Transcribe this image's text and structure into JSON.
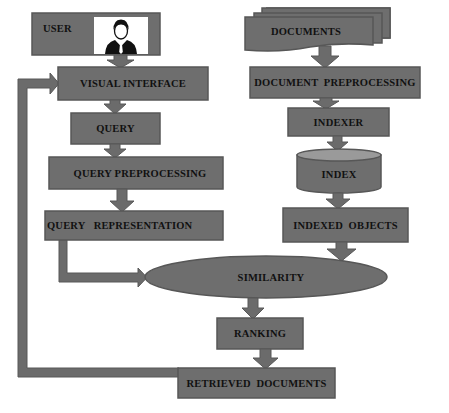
{
  "diagram": {
    "colors": {
      "box_fill": "#6e6e6e",
      "box_border": "#575757",
      "arrow_fill": "#6b6b6b",
      "text": "#111111",
      "background": "#ffffff"
    },
    "nodes": {
      "user": {
        "label": "USER",
        "shape": "rectangle",
        "icon": "user-avatar-icon"
      },
      "visual_interface": {
        "label": "VISUAL INTERFACE",
        "shape": "rectangle"
      },
      "query": {
        "label": "QUERY",
        "shape": "rectangle"
      },
      "query_preprocessing": {
        "label": "QUERY PREPROCESSING",
        "shape": "rectangle"
      },
      "query_representation": {
        "label": "QUERY   REPRESENTATION",
        "shape": "rectangle"
      },
      "documents": {
        "label": "DOCUMENTS",
        "shape": "multi-document"
      },
      "document_preprocessing": {
        "label": "DOCUMENT  PREPROCESSING",
        "shape": "rectangle"
      },
      "indexer": {
        "label": "INDEXER",
        "shape": "rectangle"
      },
      "index": {
        "label": "INDEX",
        "shape": "cylinder"
      },
      "indexed_objects": {
        "label": "INDEXED  OBJECTS",
        "shape": "rectangle"
      },
      "similarity": {
        "label": "SIMILARITY",
        "shape": "ellipse"
      },
      "ranking": {
        "label": "RANKING",
        "shape": "rectangle"
      },
      "retrieved_documents": {
        "label": "RETRIEVED  DOCUMENTS",
        "shape": "rectangle"
      }
    },
    "edges": [
      {
        "from": "USER",
        "to": "VISUAL INTERFACE"
      },
      {
        "from": "VISUAL INTERFACE",
        "to": "QUERY"
      },
      {
        "from": "QUERY",
        "to": "QUERY PREPROCESSING"
      },
      {
        "from": "QUERY PREPROCESSING",
        "to": "QUERY REPRESENTATION"
      },
      {
        "from": "QUERY REPRESENTATION",
        "to": "SIMILARITY"
      },
      {
        "from": "DOCUMENTS",
        "to": "DOCUMENT PREPROCESSING"
      },
      {
        "from": "DOCUMENT PREPROCESSING",
        "to": "INDEXER"
      },
      {
        "from": "INDEXER",
        "to": "INDEX"
      },
      {
        "from": "INDEX",
        "to": "INDEXED OBJECTS"
      },
      {
        "from": "INDEXED OBJECTS",
        "to": "SIMILARITY"
      },
      {
        "from": "SIMILARITY",
        "to": "RANKING"
      },
      {
        "from": "RANKING",
        "to": "RETRIEVED DOCUMENTS"
      },
      {
        "from": "RETRIEVED DOCUMENTS",
        "to": "VISUAL INTERFACE"
      }
    ]
  }
}
